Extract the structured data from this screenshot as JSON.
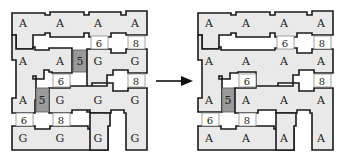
{
  "left_grid": {
    "rows": [
      [
        "A",
        "A",
        "A",
        "A"
      ],
      [
        "A",
        "A",
        "G",
        "G"
      ],
      [
        "A",
        "G",
        "G",
        "G"
      ],
      [
        "G",
        "G",
        "G",
        "G"
      ]
    ],
    "doors": [
      {
        "label": "6",
        "between": "row1-row2",
        "col": 3
      },
      {
        "label": "8",
        "between": "row1-row2",
        "col": 4
      },
      {
        "label": "6",
        "between": "row2-row3",
        "col": 2
      },
      {
        "label": "8",
        "between": "row2-row3",
        "col": 4
      },
      {
        "label": "6",
        "between": "row3-row4",
        "col": 1
      },
      {
        "label": "8",
        "between": "row3-row4",
        "col": 2
      }
    ],
    "gray_tiles": [
      {
        "label": "5",
        "row": 2,
        "between_cols": "2-3"
      },
      {
        "label": "5",
        "row": 3,
        "between_cols": "1-2"
      }
    ]
  },
  "right_grid": {
    "rows": [
      [
        "A",
        "A",
        "A",
        "A"
      ],
      [
        "A",
        "A",
        "A",
        "A"
      ],
      [
        "A",
        "A",
        "A",
        "A"
      ],
      [
        "A",
        "A",
        "A",
        "A"
      ]
    ],
    "doors": [
      {
        "label": "6",
        "between": "row1-row2",
        "col": 3
      },
      {
        "label": "8",
        "between": "row1-row2",
        "col": 4
      },
      {
        "label": "6",
        "between": "row2-row3",
        "col": 2
      },
      {
        "label": "8",
        "between": "row2-row3",
        "col": 4
      },
      {
        "label": "6",
        "between": "row3-row4",
        "col": 1
      },
      {
        "label": "8",
        "between": "row3-row4",
        "col": 2
      }
    ],
    "gray_tiles": [
      {
        "label": "5",
        "row": 3,
        "between_cols": "1-2"
      }
    ]
  },
  "labels": {
    "L": {
      "r1": [
        "A",
        "A",
        "A",
        "A"
      ],
      "r2": [
        "A",
        "A",
        "G",
        "G"
      ],
      "r3": [
        "A",
        "G",
        "G",
        "G"
      ],
      "r4": [
        "G",
        "G",
        "G",
        "G"
      ],
      "d12a": "6",
      "d12b": "8",
      "d23a": "6",
      "d23b": "8",
      "d34a": "6",
      "d34b": "8",
      "g2": "5",
      "g3": "5"
    },
    "R": {
      "r1": [
        "A",
        "A",
        "A",
        "A"
      ],
      "r2": [
        "A",
        "A",
        "A",
        "A"
      ],
      "r3": [
        "A",
        "A",
        "A",
        "A"
      ],
      "r4": [
        "A",
        "A",
        "A",
        "A"
      ],
      "d12a": "6",
      "d12b": "8",
      "d23a": "6",
      "d23b": "8",
      "d34a": "6",
      "d34b": "8",
      "g3": "5"
    }
  },
  "arrow": {
    "direction": "right"
  }
}
